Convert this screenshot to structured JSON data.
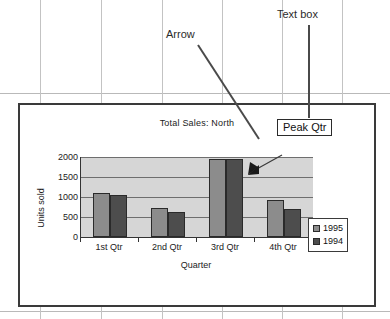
{
  "annotations": {
    "arrow_callout": "Arrow",
    "textbox_callout": "Text box",
    "textbox_content": "Peak Qtr"
  },
  "chart_data": {
    "type": "bar",
    "title": "Total Sales: North",
    "xlabel": "Quarter",
    "ylabel": "Units sold",
    "categories": [
      "1st Qtr",
      "2nd Qtr",
      "3rd Qtr",
      "4th Qtr"
    ],
    "series": [
      {
        "name": "1995",
        "color": "#8c8c8c",
        "values": [
          1100,
          720,
          1950,
          920
        ]
      },
      {
        "name": "1994",
        "color": "#4d4d4d",
        "values": [
          1040,
          620,
          1960,
          690
        ]
      }
    ],
    "ylim": [
      0,
      2000
    ],
    "yticks": [
      0,
      500,
      1000,
      1500,
      2000
    ],
    "ytick_labels": [
      "0",
      "500",
      "1000",
      "1500",
      "2000"
    ],
    "grid": true,
    "legend_position": "right",
    "legend_entries": [
      "1995",
      "1994"
    ],
    "plot_background": "#d6d6d6"
  }
}
